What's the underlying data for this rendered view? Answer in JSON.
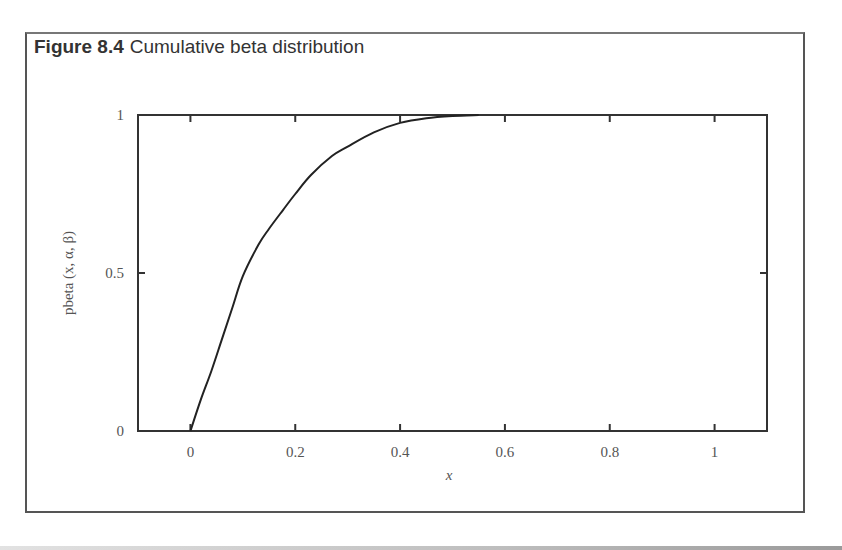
{
  "figure": {
    "number_label": "Figure 8.4",
    "caption": "Cumulative beta distribution"
  },
  "chart_data": {
    "type": "line",
    "title": "Cumulative beta distribution",
    "xlabel": "x",
    "ylabel": "pbeta (x, α, β)",
    "xlim": [
      -0.1,
      1.1
    ],
    "ylim": [
      0,
      1
    ],
    "x_ticks": [
      0,
      0.2,
      0.4,
      0.6,
      0.8,
      1
    ],
    "x_tick_labels": [
      "0",
      "0.2",
      "0.4",
      "0.6",
      "0.8",
      "1"
    ],
    "y_ticks": [
      0,
      0.5,
      1
    ],
    "y_tick_labels": [
      "0",
      "0.5",
      "1"
    ],
    "grid": false,
    "legend": null,
    "series": [
      {
        "name": "pbeta",
        "x": [
          0,
          0.02,
          0.04,
          0.06,
          0.08,
          0.1,
          0.13,
          0.15,
          0.177,
          0.2,
          0.23,
          0.27,
          0.3,
          0.35,
          0.4,
          0.45,
          0.5,
          0.55
        ],
        "values": [
          0,
          0.1,
          0.19,
          0.29,
          0.39,
          0.49,
          0.59,
          0.64,
          0.7,
          0.75,
          0.81,
          0.87,
          0.9,
          0.945,
          0.975,
          0.99,
          0.997,
          1.0
        ]
      }
    ]
  }
}
